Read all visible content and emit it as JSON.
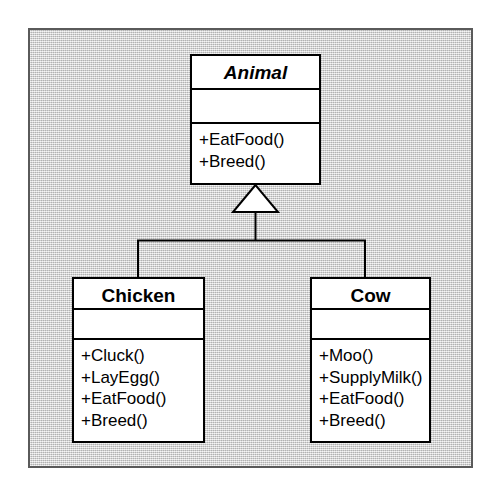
{
  "diagram": {
    "type": "uml-class-diagram",
    "canvas_background": "#cfcfcf",
    "frame_border_color": "#5a5a5a",
    "class_fill_color": "#ffffff",
    "class_border_color": "#000000",
    "connector_color": "#000000",
    "classes": [
      {
        "id": "animal",
        "name": "Animal",
        "stereotype": "abstract",
        "is_abstract": true,
        "attributes": [],
        "operations": [
          "+EatFood()",
          "+Breed()"
        ]
      },
      {
        "id": "chicken",
        "name": "Chicken",
        "stereotype": "concrete",
        "is_abstract": false,
        "attributes": [],
        "operations": [
          "+Cluck()",
          "+LayEgg()",
          "+EatFood()",
          "+Breed()"
        ]
      },
      {
        "id": "cow",
        "name": "Cow",
        "stereotype": "concrete",
        "is_abstract": false,
        "attributes": [],
        "operations": [
          "+Moo()",
          "+SupplyMilk()",
          "+EatFood()",
          "+Breed()"
        ]
      }
    ],
    "relationships": [
      {
        "kind": "generalization",
        "source": "Chicken",
        "target": "Animal",
        "arrow": "hollow-triangle",
        "routing": "orthogonal"
      },
      {
        "kind": "generalization",
        "source": "Cow",
        "target": "Animal",
        "arrow": "hollow-triangle",
        "routing": "orthogonal"
      }
    ]
  }
}
